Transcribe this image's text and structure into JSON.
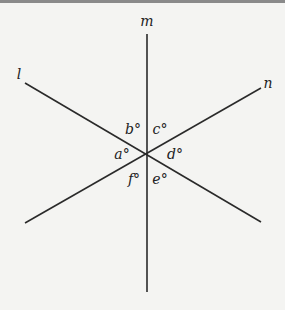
{
  "figure": {
    "lines": [
      {
        "name": "l",
        "label": "l"
      },
      {
        "name": "m",
        "label": "m"
      },
      {
        "name": "n",
        "label": "n"
      }
    ],
    "angles": {
      "a": "a°",
      "b": "b°",
      "c": "c°",
      "d": "d°",
      "e": "e°",
      "f": "f°"
    }
  }
}
